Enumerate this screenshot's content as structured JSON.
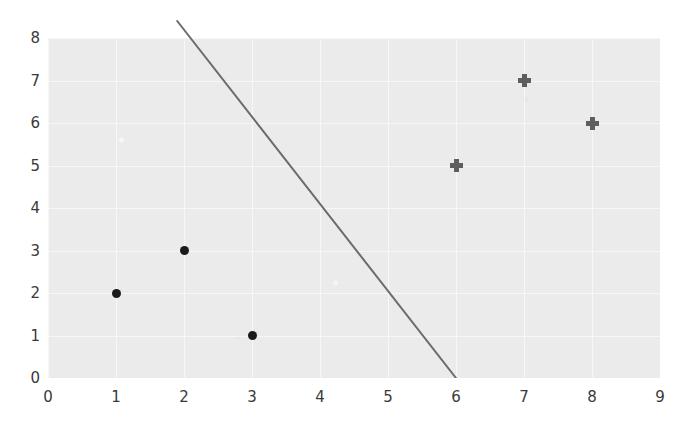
{
  "chart_data": {
    "type": "scatter",
    "title": "",
    "xlabel": "",
    "ylabel": "",
    "xlim": [
      0,
      9
    ],
    "ylim": [
      0,
      8
    ],
    "grid": true,
    "legend": "none",
    "background_color": "#ebebeb",
    "gridline_color": "#f7f7f7",
    "xticks": [
      "0",
      "1",
      "2",
      "3",
      "4",
      "5",
      "6",
      "7",
      "8",
      "9"
    ],
    "yticks": [
      "0",
      "1",
      "2",
      "3",
      "4",
      "5",
      "6",
      "7",
      "8"
    ],
    "series": [
      {
        "name": "circle-points",
        "marker": "filled-circle",
        "color": "#1a1a1a",
        "points": [
          {
            "x": 1,
            "y": 2
          },
          {
            "x": 2,
            "y": 3
          },
          {
            "x": 3,
            "y": 1
          }
        ]
      },
      {
        "name": "plus-points",
        "marker": "plus",
        "color": "#5e5e5e",
        "points": [
          {
            "x": 6,
            "y": 5
          },
          {
            "x": 7,
            "y": 7
          },
          {
            "x": 8,
            "y": 6
          }
        ]
      }
    ],
    "line": {
      "name": "decision-boundary-line",
      "color": "#6b6b6b",
      "width": 2,
      "slope": -2.05,
      "intercept": 12.3,
      "start": {
        "x": 1.9,
        "y": 8.4
      },
      "end": {
        "x": 6,
        "y": 0
      }
    }
  }
}
